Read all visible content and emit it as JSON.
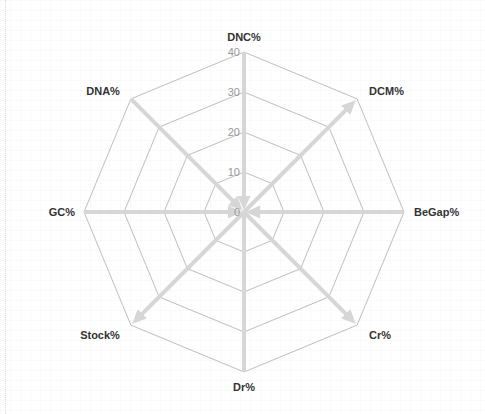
{
  "chart_data": {
    "type": "radar",
    "title": "",
    "axes": [
      "DNC%",
      "DCM%",
      "BeGap%",
      "Cr%",
      "Dr%",
      "Stock%",
      "GC%",
      "DNA%"
    ],
    "rlim": [
      0,
      40
    ],
    "ticks": [
      "0",
      "10",
      "20",
      "30",
      "40"
    ],
    "tick_values": [
      0,
      10,
      20,
      30,
      40
    ],
    "grid": true,
    "grid_shape": "octagon",
    "series": [
      {
        "axis": "DNC%",
        "from": 40,
        "to": 0,
        "direction": "inward",
        "arrow": true
      },
      {
        "axis": "DCM%",
        "from": 0,
        "to": 40,
        "direction": "outward",
        "arrow": true
      },
      {
        "axis": "BeGap%",
        "from": 40,
        "to": 0,
        "direction": "inward",
        "arrow": true
      },
      {
        "axis": "Cr%",
        "from": 0,
        "to": 40,
        "direction": "outward",
        "arrow": true
      },
      {
        "axis": "Dr%",
        "from": 0,
        "to": 40,
        "direction": "none",
        "arrow": false
      },
      {
        "axis": "Stock%",
        "from": 0,
        "to": 40,
        "direction": "outward",
        "arrow": true
      },
      {
        "axis": "GC%",
        "from": 40,
        "to": 0,
        "direction": "inward",
        "arrow": true
      },
      {
        "axis": "DNA%",
        "from": 40,
        "to": 0,
        "direction": "inward",
        "arrow": true
      }
    ],
    "colors": {
      "spoke": "#d6d6d6",
      "ring": "#b5b5b5",
      "label": "#333333",
      "tick": "#999999"
    }
  }
}
